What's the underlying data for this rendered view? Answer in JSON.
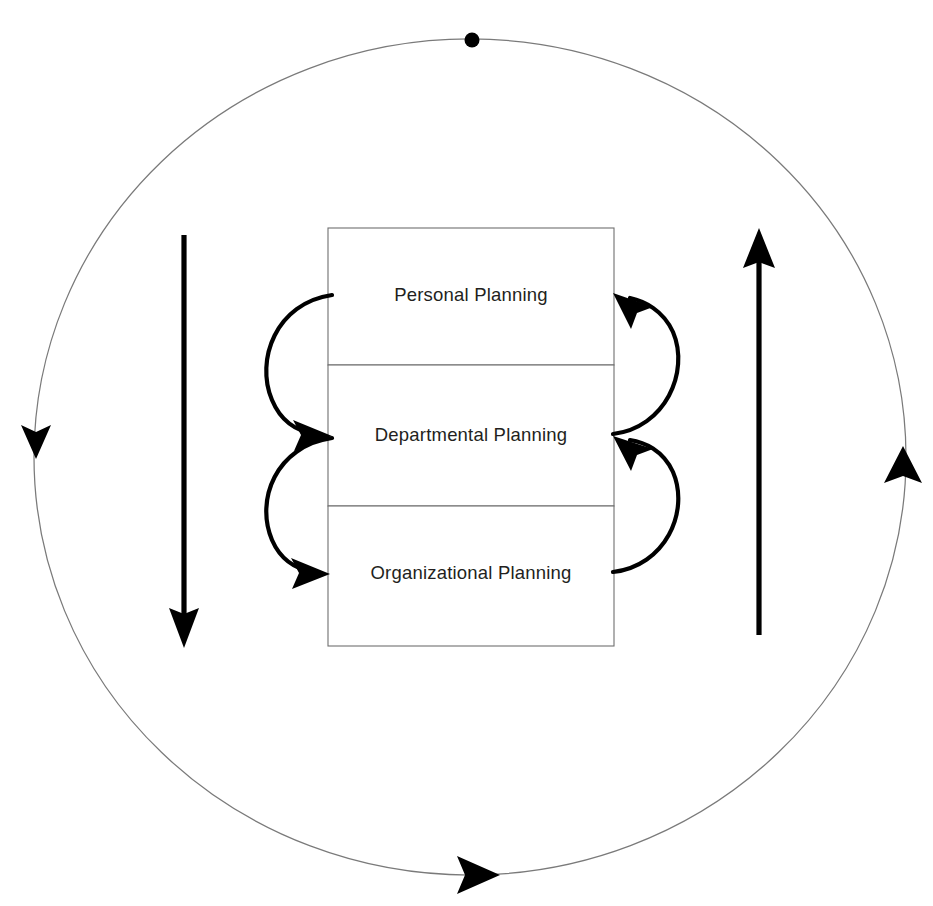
{
  "diagram": {
    "type": "cycle-diagram",
    "canvas": {
      "width": 933,
      "height": 906,
      "background": "#ffffff"
    },
    "colors": {
      "text": "#231f20",
      "box_border": "#6f6f6f",
      "circle_stroke": "#7a7a7a",
      "arrow": "#000000",
      "box_fill": "#ffffff"
    },
    "tiers": [
      {
        "label": "Personal Planning",
        "order": 1,
        "box": {
          "x": 328,
          "y": 228,
          "width": 286,
          "height": 137
        },
        "label_center": {
          "x": 471,
          "y": 296
        }
      },
      {
        "label": "Departmental Planning",
        "order": 2,
        "box": {
          "x": 328,
          "y": 365,
          "width": 286,
          "height": 141
        },
        "label_center": {
          "x": 471,
          "y": 436
        }
      },
      {
        "label": "Organizational Planning",
        "order": 3,
        "box": {
          "x": 328,
          "y": 506,
          "width": 286,
          "height": 140
        },
        "label_center": {
          "x": 471,
          "y": 574
        }
      }
    ],
    "outer_cycle": {
      "name": "outer-cycle-ellipse",
      "center": {
        "x": 470,
        "y": 457
      },
      "radius_x": 436,
      "radius_y": 418,
      "direction": "counter-clockwise",
      "markers": [
        {
          "name": "cycle-start-dot",
          "shape": "dot",
          "x": 472,
          "y": 40
        },
        {
          "name": "cycle-arrow-left",
          "shape": "triangle-down",
          "x": 36,
          "y": 443
        },
        {
          "name": "cycle-arrow-bottom",
          "shape": "triangle-right",
          "x": 478,
          "y": 875
        },
        {
          "name": "cycle-arrow-right",
          "shape": "triangle-up",
          "x": 903,
          "y": 464
        }
      ]
    },
    "straight_arrows": [
      {
        "name": "left-downward-arrow",
        "direction": "down",
        "x": 184,
        "y_start": 235,
        "y_end": 645
      },
      {
        "name": "right-upward-arrow",
        "direction": "up",
        "x": 759,
        "y_start": 635,
        "y_end": 230
      }
    ],
    "curved_arrows": [
      {
        "name": "curve-personal-to-departmental",
        "side": "left",
        "from_tier": 1,
        "to_tier": 2,
        "direction": "down"
      },
      {
        "name": "curve-departmental-to-organizational",
        "side": "left",
        "from_tier": 2,
        "to_tier": 3,
        "direction": "down"
      },
      {
        "name": "curve-organizational-to-departmental",
        "side": "right",
        "from_tier": 3,
        "to_tier": 2,
        "direction": "up"
      },
      {
        "name": "curve-departmental-to-personal",
        "side": "right",
        "from_tier": 2,
        "to_tier": 1,
        "direction": "up"
      }
    ]
  }
}
